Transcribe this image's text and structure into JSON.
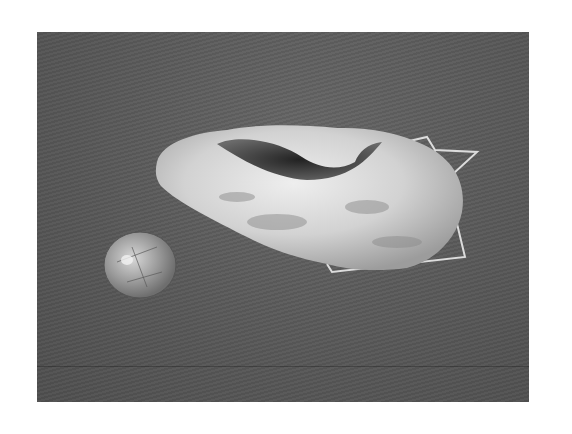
{
  "image": {
    "description": "Black-and-white photograph of a hollow geode on a wire stand beside a small polished rock-crystal cabochon, on a gray fabric backdrop",
    "subjects": [
      {
        "name": "geode",
        "note": "rough white crystalline exterior with dark hollow cavity"
      },
      {
        "name": "wire-stand",
        "note": "thin bent metal wire support behind/right of geode"
      },
      {
        "name": "polished-stone",
        "note": "round clear quartz cabochon with rutile-like inclusions"
      }
    ],
    "colors": {
      "page": "#ffffff",
      "backdrop": "#5b5b5b",
      "geode_light": "#e6e6e6",
      "geode_shadow": "#8a8a8a",
      "cavity": "#2e2e2e",
      "wire": "#dcdcdc",
      "stone": "#9a9a9a"
    }
  }
}
